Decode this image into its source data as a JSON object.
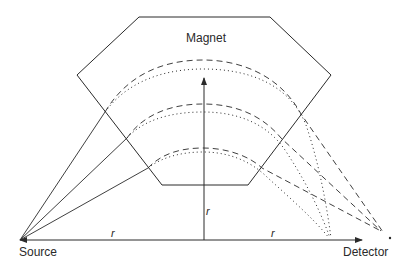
{
  "diagram": {
    "type": "mass-spectrometer-schematic",
    "labels": {
      "magnet": "Magnet",
      "source": "Source",
      "detector": "Detector",
      "radius_left": "r",
      "radius_right": "r",
      "radius_vertical": "r"
    },
    "colors": {
      "line": "#2a2a2a",
      "background": "#ffffff"
    },
    "trajectories": [
      {
        "name": "outer",
        "styles": [
          "dashed",
          "dotted"
        ]
      },
      {
        "name": "middle",
        "styles": [
          "dashed",
          "dotted"
        ]
      },
      {
        "name": "inner",
        "styles": [
          "dashed",
          "dotted"
        ]
      }
    ]
  }
}
